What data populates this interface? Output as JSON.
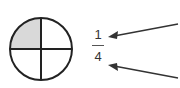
{
  "diagram": {
    "shape": "circle",
    "parts": 4,
    "shaded_parts": 1,
    "shaded_color": "#d9d9d9",
    "stroke_color": "#222222"
  },
  "fraction": {
    "numerator": "1",
    "denominator": "4"
  },
  "arrows": [
    {
      "points_to": "numerator"
    },
    {
      "points_to": "denominator"
    }
  ]
}
